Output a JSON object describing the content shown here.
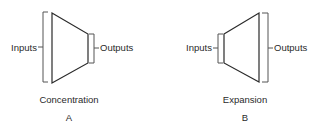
{
  "panels": [
    {
      "id": "A",
      "inputs_label": "Inputs",
      "outputs_label": "Outputs",
      "caption": "Concentration",
      "letter": "A",
      "shape": "converging"
    },
    {
      "id": "B",
      "inputs_label": "Inputs",
      "outputs_label": "Outputs",
      "caption": "Expansion",
      "letter": "B",
      "shape": "diverging"
    }
  ]
}
